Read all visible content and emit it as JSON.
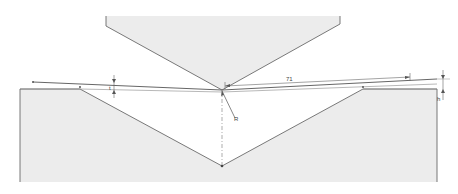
{
  "diagram": {
    "type": "press-brake-air-bending",
    "colors": {
      "fill": "#ececec",
      "outline": "#6a6a6a",
      "line": "#555555",
      "dim": "#777777"
    },
    "dimensions": {
      "flange_length_label": "71",
      "radius_label": "R",
      "left_thickness_label": "t",
      "right_height_label": "h"
    },
    "components": {
      "punch": "Punch (upper tool)",
      "die": "V-die (lower tool)",
      "sheet": "Sheet metal",
      "centerline": "Bend centerline"
    }
  }
}
